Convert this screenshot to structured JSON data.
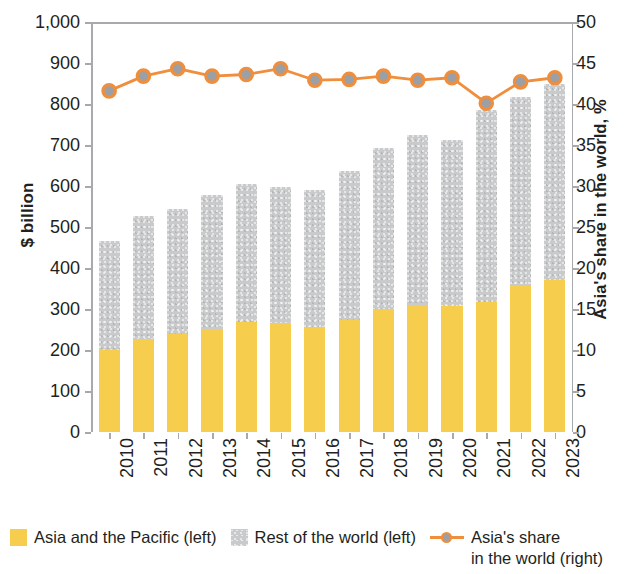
{
  "chart_data": {
    "type": "bar",
    "title": "",
    "subtitle": "",
    "xlabel": "",
    "ylabel": "$ billion",
    "y2label": "Asia's share in the world, %",
    "categories": [
      "2010",
      "2011",
      "2012",
      "2013",
      "2014",
      "2015",
      "2016",
      "2017",
      "2018",
      "2019",
      "2020",
      "2021",
      "2022",
      "2023"
    ],
    "ylim": [
      0,
      1000
    ],
    "yticks": [
      "0",
      "100",
      "200",
      "300",
      "400",
      "500",
      "600",
      "700",
      "800",
      "900",
      "1,000"
    ],
    "ytick_values": [
      0,
      100,
      200,
      300,
      400,
      500,
      600,
      700,
      800,
      900,
      1000
    ],
    "y2lim": [
      0,
      50
    ],
    "y2ticks": [
      "0",
      "5",
      "10",
      "15",
      "20",
      "25",
      "30",
      "35",
      "40",
      "45",
      "50"
    ],
    "y2tick_values": [
      0,
      5,
      10,
      15,
      20,
      25,
      30,
      35,
      40,
      45,
      50
    ],
    "grid": false,
    "legend_position": "bottom",
    "series": [
      {
        "name": "Asia and the Pacific (left)",
        "type": "bar",
        "stack": "total",
        "axis": "left",
        "color": "#f7cd4d",
        "values": [
          200,
          228,
          240,
          251,
          268,
          267,
          257,
          274,
          301,
          311,
          308,
          318,
          356,
          371
        ]
      },
      {
        "name": "Rest of the world (left)",
        "type": "bar",
        "stack": "total",
        "axis": "left",
        "color": "#c9cacb",
        "values": [
          266,
          298,
          303,
          328,
          338,
          330,
          333,
          363,
          392,
          414,
          405,
          468,
          462,
          478
        ]
      },
      {
        "name": "Asia's share in the world (right)",
        "type": "line",
        "axis": "right",
        "color": "#ef8e3c",
        "marker_fill": "#9aa0a6",
        "values": [
          41.6,
          43.4,
          44.3,
          43.4,
          43.6,
          44.3,
          42.9,
          43.0,
          43.4,
          42.9,
          43.2,
          40.1,
          42.7,
          43.2
        ]
      }
    ],
    "totals": [
      466,
      526,
      543,
      579,
      606,
      597,
      590,
      637,
      693,
      725,
      713,
      786,
      818,
      849
    ]
  },
  "legend": {
    "items": [
      {
        "label": "Asia and the Pacific (left)",
        "marker": "square-swatch-yellow"
      },
      {
        "label": "Rest of the world (left)",
        "marker": "square-swatch-gray"
      },
      {
        "label": "Asia's share\nin the world (right)",
        "marker": "line-with-dot-orange"
      }
    ]
  },
  "colors": {
    "asia": "#f7cd4d",
    "rest": "#c9cacb",
    "line": "#ef8e3c",
    "marker": "#9aa0a6",
    "axis": "#a7a9ac",
    "text": "#231f20"
  }
}
